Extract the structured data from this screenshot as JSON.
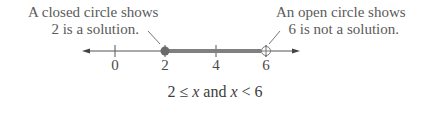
{
  "annotations": {
    "closed": {
      "line1": "A closed circle shows",
      "line2": "2 is a solution."
    },
    "open": {
      "line1": "An open circle shows",
      "line2": "6 is not a solution."
    }
  },
  "number_line": {
    "ticks": [
      {
        "value": "0",
        "x": 115
      },
      {
        "value": "2",
        "x": 165
      },
      {
        "value": "4",
        "x": 216
      },
      {
        "value": "6",
        "x": 266
      }
    ],
    "closed_endpoint": "2",
    "open_endpoint": "6",
    "colors": {
      "line": "#555555",
      "shaded": "#808080"
    }
  },
  "inequality": {
    "part1": "2 ≤ ",
    "var1": "x",
    "part2": " and ",
    "var2": "x",
    "part3": " < 6"
  }
}
